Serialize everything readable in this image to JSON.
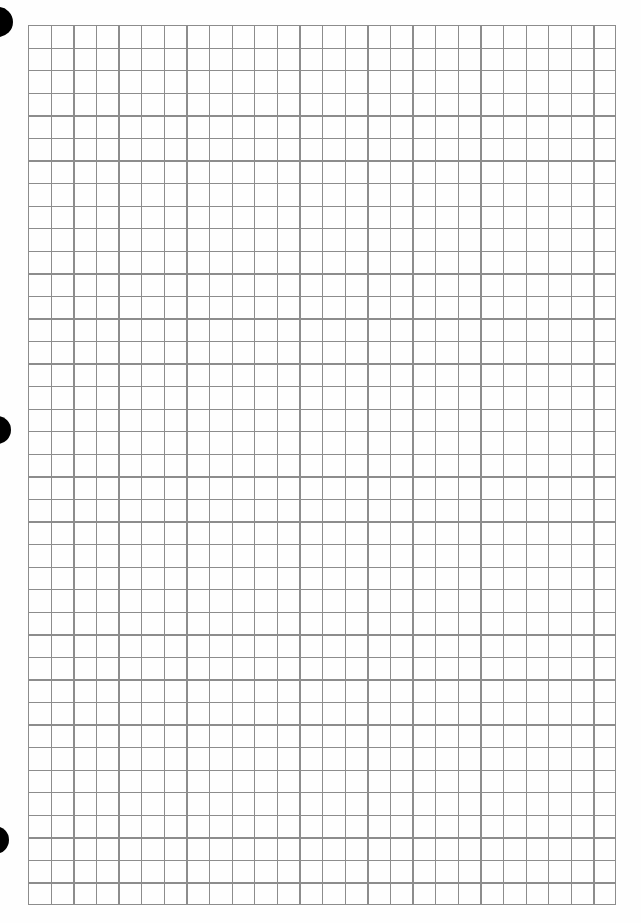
{
  "document": {
    "type": "graph-paper-sheet",
    "background_color": "#fefefe",
    "line_color": "#8c8c8c"
  },
  "grid": {
    "left": 28,
    "top": 25,
    "width": 588,
    "height": 880,
    "columns": 26,
    "rows": 39
  },
  "punch_holes": [
    {
      "name": "top",
      "cx": -2,
      "cy": 22,
      "r": 15
    },
    {
      "name": "middle",
      "cx": -3,
      "cy": 430,
      "r": 14
    },
    {
      "name": "bottom",
      "cx": -5,
      "cy": 840,
      "r": 14
    }
  ]
}
